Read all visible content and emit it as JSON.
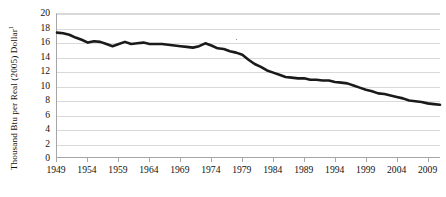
{
  "chart_data": {
    "type": "line",
    "title": "",
    "xlabel": "",
    "ylabel": "Thousand Btu per Real (2005) Dollar",
    "ylabel_superscript": "1",
    "ylim": [
      0,
      20
    ],
    "xlim": [
      1949,
      2011
    ],
    "ytick_labels": [
      "20",
      "18",
      "16",
      "14",
      "12",
      "10",
      "8",
      "6",
      "4",
      "2",
      "0"
    ],
    "ytick_values": [
      20,
      18,
      16,
      14,
      12,
      10,
      8,
      6,
      4,
      2,
      0
    ],
    "xtick_labels": [
      "1949",
      "1954",
      "1959",
      "1964",
      "1969",
      "1974",
      "1979",
      "1984",
      "1989",
      "1994",
      "1999",
      "2004",
      "2009"
    ],
    "xtick_values": [
      1949,
      1954,
      1959,
      1964,
      1969,
      1974,
      1979,
      1984,
      1989,
      1994,
      1999,
      2004,
      2009
    ],
    "grid": true,
    "legend": "none",
    "line_color": "#1a1a1a",
    "line_width": 2.6,
    "x": [
      1949,
      1950,
      1951,
      1952,
      1953,
      1954,
      1955,
      1956,
      1957,
      1958,
      1959,
      1960,
      1961,
      1962,
      1963,
      1964,
      1965,
      1966,
      1967,
      1968,
      1969,
      1970,
      1971,
      1972,
      1973,
      1974,
      1975,
      1976,
      1977,
      1978,
      1979,
      1980,
      1981,
      1982,
      1983,
      1984,
      1985,
      1986,
      1987,
      1988,
      1989,
      1990,
      1991,
      1992,
      1993,
      1994,
      1995,
      1996,
      1997,
      1998,
      1999,
      2000,
      2001,
      2002,
      2003,
      2004,
      2005,
      2006,
      2007,
      2008,
      2009,
      2010,
      2011
    ],
    "values": [
      17.4,
      17.3,
      17.1,
      16.7,
      16.4,
      16.0,
      16.2,
      16.1,
      15.8,
      15.5,
      15.8,
      16.1,
      15.8,
      15.9,
      16.0,
      15.8,
      15.8,
      15.8,
      15.7,
      15.6,
      15.5,
      15.4,
      15.3,
      15.5,
      15.9,
      15.6,
      15.2,
      15.1,
      14.8,
      14.6,
      14.3,
      13.6,
      13.0,
      12.6,
      12.1,
      11.8,
      11.5,
      11.2,
      11.1,
      11.0,
      11.0,
      10.8,
      10.8,
      10.7,
      10.7,
      10.5,
      10.4,
      10.3,
      10.0,
      9.7,
      9.4,
      9.2,
      8.9,
      8.8,
      8.6,
      8.4,
      8.2,
      7.9,
      7.8,
      7.7,
      7.5,
      7.4,
      7.3
    ]
  }
}
